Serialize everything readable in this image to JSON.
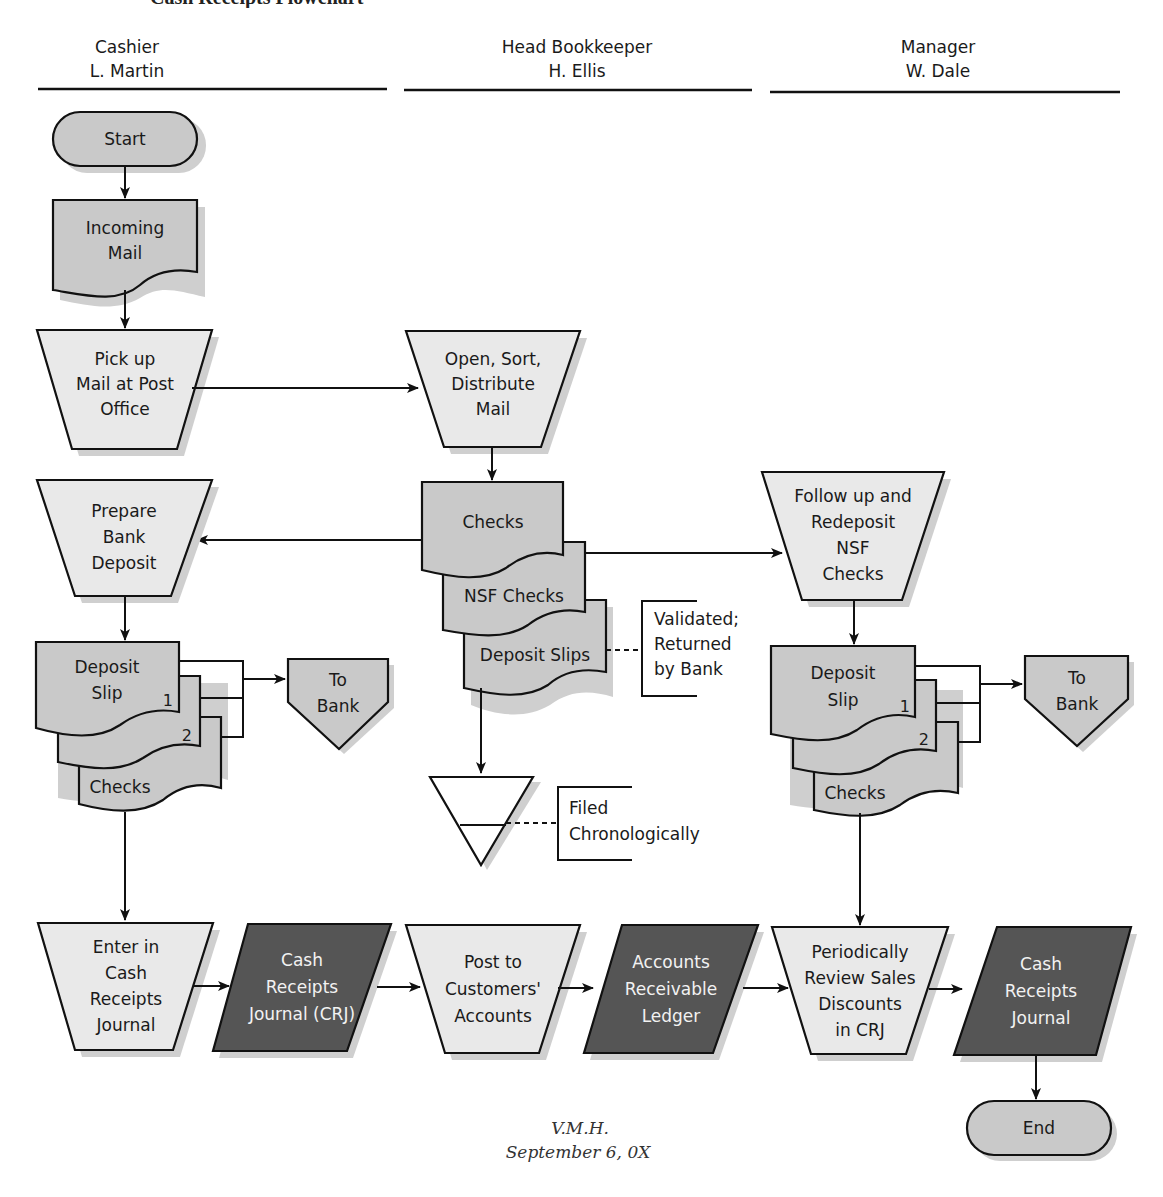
{
  "title": "Cash Receipts Flowchart",
  "colors": {
    "process_fill": "#e9e9e9",
    "document_fill": "#c9c9c9",
    "ledger_fill": "#555555",
    "stroke": "#111111"
  },
  "lanes": [
    {
      "role": "Cashier",
      "person": "L. Martin"
    },
    {
      "role": "Head Bookkeeper",
      "person": "H. Ellis"
    },
    {
      "role": "Manager",
      "person": "W. Dale"
    }
  ],
  "nodes": {
    "start": {
      "label": "Start",
      "type": "terminator"
    },
    "incoming_mail": {
      "lines": [
        "Incoming",
        "Mail"
      ],
      "type": "document"
    },
    "pick_up_mail": {
      "lines": [
        "Pick up",
        "Mail at Post",
        "Office"
      ],
      "type": "manual-operation"
    },
    "open_sort": {
      "lines": [
        "Open, Sort,",
        "Distribute",
        "Mail"
      ],
      "type": "manual-operation"
    },
    "prepare_deposit": {
      "lines": [
        "Prepare",
        "Bank",
        "Deposit"
      ],
      "type": "manual-operation"
    },
    "checks_stack": {
      "docs": [
        "Checks",
        "NSF Checks",
        "Deposit Slips"
      ],
      "type": "multi-document"
    },
    "validated_note": {
      "lines": [
        "Validated;",
        "Returned",
        "by Bank"
      ],
      "type": "annotation"
    },
    "follow_up": {
      "lines": [
        "Follow up and",
        "Redeposit",
        "NSF",
        "Checks"
      ],
      "type": "manual-operation"
    },
    "cashier_deposit_stack": {
      "lines": [
        "Deposit",
        "Slip"
      ],
      "copy_numbers": [
        "1",
        "2"
      ],
      "back_doc": "Checks",
      "type": "multi-document"
    },
    "cashier_to_bank": {
      "lines": [
        "To",
        "Bank"
      ],
      "type": "off-page-connector"
    },
    "manager_deposit_stack": {
      "lines": [
        "Deposit",
        "Slip"
      ],
      "copy_numbers": [
        "1",
        "2"
      ],
      "back_doc": "Checks",
      "type": "multi-document"
    },
    "manager_to_bank": {
      "lines": [
        "To",
        "Bank"
      ],
      "type": "off-page-connector"
    },
    "file": {
      "type": "offline-storage"
    },
    "file_note": {
      "lines": [
        "Filed",
        "Chronologically"
      ],
      "type": "annotation"
    },
    "enter_crj": {
      "lines": [
        "Enter in",
        "Cash",
        "Receipts",
        "Journal"
      ],
      "type": "manual-operation"
    },
    "crj": {
      "lines": [
        "Cash",
        "Receipts",
        "Journal (CRJ)"
      ],
      "type": "ledger"
    },
    "post_accounts": {
      "lines": [
        "Post to",
        "Customers'",
        "Accounts"
      ],
      "type": "manual-operation"
    },
    "ar_ledger": {
      "lines": [
        "Accounts",
        "Receivable",
        "Ledger"
      ],
      "type": "ledger"
    },
    "review": {
      "lines": [
        "Periodically",
        "Review Sales",
        "Discounts",
        "in CRJ"
      ],
      "type": "manual-operation"
    },
    "crj_manager": {
      "lines": [
        "Cash",
        "Receipts",
        "Journal"
      ],
      "type": "ledger"
    },
    "end": {
      "label": "End",
      "type": "terminator"
    }
  },
  "signature": {
    "initials": "V.M.H.",
    "date": "September 6, 0X"
  }
}
